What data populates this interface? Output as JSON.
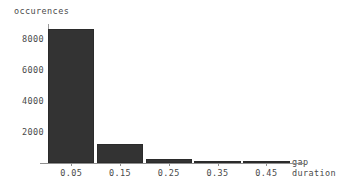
{
  "chart_data": {
    "type": "bar",
    "title": "",
    "subtitle": "",
    "xlabel": "gap duration",
    "xlabel_lines": [
      "gap",
      "duration"
    ],
    "ylabel": "occurences",
    "categories": [
      "0.05",
      "0.15",
      "0.25",
      "0.35",
      "0.45"
    ],
    "values": [
      8700,
      1200,
      250,
      60,
      30
    ],
    "series": [
      {
        "name": "occurences",
        "values": [
          8700,
          1200,
          250,
          60,
          30
        ]
      }
    ],
    "xtick_labels": [
      "0.05",
      "0.15",
      "0.25",
      "0.35",
      "0.45"
    ],
    "ytick_labels": [
      "2000",
      "4000",
      "6000",
      "8000"
    ],
    "ytick_values": [
      2000,
      4000,
      6000,
      8000
    ],
    "xlim": [
      0.0,
      0.5
    ],
    "ylim": [
      0,
      9000
    ],
    "grid": false,
    "legend": false,
    "legend_position": "none",
    "bar_color": "#333333",
    "axis_color": "#8f8f8f",
    "text_color": "#4a4a4a",
    "background_color": "#ffffff",
    "bin_width": 0.1,
    "bin_edges": [
      0.0,
      0.1,
      0.2,
      0.3,
      0.4,
      0.5
    ],
    "annotations": []
  }
}
